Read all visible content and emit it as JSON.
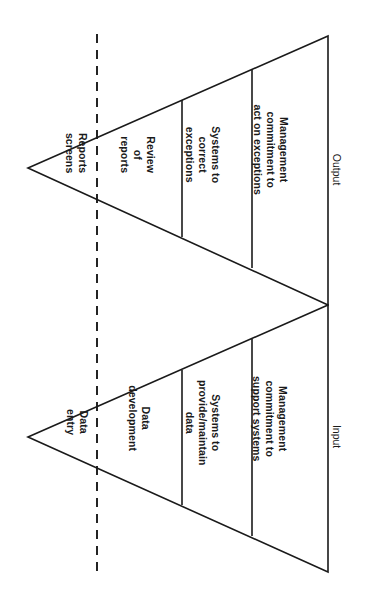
{
  "diagram": {
    "orientation": "rotated-90-clockwise",
    "stroke_color": "#1a1a1a",
    "background_color": "#ffffff",
    "upper_triangle": {
      "axis_label": "Output",
      "segments": [
        {
          "id": "reports-screens",
          "text": "Reports\nscreens"
        },
        {
          "id": "review-of-reports",
          "text": "Review\nof\nreports"
        },
        {
          "id": "systems-to-correct-exceptions",
          "text": "Systems to\ncorrect\nexceptions"
        },
        {
          "id": "management-commitment-act",
          "text": "Management\ncommitment to\nact on exceptions"
        }
      ]
    },
    "lower_triangle": {
      "axis_label": "Input",
      "segments": [
        {
          "id": "data-entry",
          "text": "Data\nentry"
        },
        {
          "id": "data-development",
          "text": "Data\ndevelopment"
        },
        {
          "id": "systems-to-provide-maintain-data",
          "text": "Systems to\nprovide/maintain\ndata"
        },
        {
          "id": "management-commitment-support",
          "text": "Management\ncommitment to\nsupport systems"
        }
      ]
    },
    "divider": {
      "id": "dashed-divider",
      "style": "dashed-vertical"
    }
  }
}
